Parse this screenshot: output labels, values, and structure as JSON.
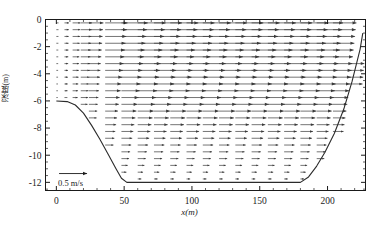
{
  "figure": {
    "type": "vector-field-section",
    "axes": {
      "xlabel": "x(m)",
      "ylabel": "深度(m)",
      "xticks": [
        0,
        50,
        100,
        150,
        200
      ],
      "xtick_labels": [
        "0",
        "50",
        "100",
        "150",
        "200"
      ],
      "yticks": [
        0,
        -2,
        -4,
        -6,
        -8,
        -10,
        -12
      ],
      "ytick_labels": [
        "0",
        "-2",
        "-4",
        "-6",
        "-8",
        "-10",
        "-12"
      ],
      "xlim": [
        -8,
        228
      ],
      "ylim": [
        -12.6,
        0
      ],
      "xminor_step": 10,
      "yminor_step": 0.5,
      "grid": false
    },
    "scale_arrow": {
      "label": "0.5 m/s",
      "value": 0.5,
      "units": "m/s",
      "x_position": 2,
      "y_position": -11.9
    },
    "colors": {
      "arrow": "#3a3a3a",
      "bed_line": "#2b2b2b",
      "axis": "#1a1a1a",
      "background": "#ffffff"
    }
  },
  "chart_data": {
    "type": "scatter",
    "title": "",
    "xlabel": "x(m)",
    "ylabel": "深度(m)",
    "xlim": [
      -8,
      228
    ],
    "ylim": [
      -12.6,
      0
    ],
    "grid": false,
    "legend": "none",
    "annotations": [
      "0.5 m/s"
    ],
    "bed_profile": {
      "name": "bed elevation",
      "x": [
        0,
        8,
        14,
        20,
        26,
        32,
        38,
        44,
        48,
        52,
        180,
        186,
        192,
        198,
        205,
        212,
        218,
        224,
        226
      ],
      "y": [
        -6.0,
        -6.05,
        -6.3,
        -6.9,
        -7.8,
        -8.8,
        -9.9,
        -11.0,
        -11.7,
        -12.0,
        -12.0,
        -11.6,
        -10.8,
        -9.8,
        -8.4,
        -6.6,
        -4.6,
        -2.2,
        -1.0
      ]
    },
    "vector_field": {
      "description": "Horizontal velocity vectors in a vertical section; arrows point in +x direction, longest near the free surface and shortest near the bed and near the left boundary.",
      "column_x": [
        0,
        6,
        12,
        18,
        24,
        36,
        48,
        60,
        72,
        84,
        96,
        108,
        120,
        132,
        144,
        156,
        168,
        180,
        192,
        204,
        216,
        224
      ],
      "row_depth": [
        -0.25,
        -0.75,
        -1.25,
        -1.75,
        -2.25,
        -2.75,
        -3.25,
        -3.75,
        -4.25,
        -4.75,
        -5.25,
        -5.75,
        -6.25,
        -6.75,
        -7.25,
        -7.75,
        -8.25,
        -8.75,
        -9.25,
        -9.75,
        -10.25,
        -10.75,
        -11.25,
        -11.75
      ],
      "u_surface_by_column": [
        0.04,
        0.08,
        0.14,
        0.2,
        0.26,
        0.4,
        0.47,
        0.5,
        0.5,
        0.5,
        0.5,
        0.5,
        0.5,
        0.5,
        0.5,
        0.5,
        0.5,
        0.5,
        0.47,
        0.42,
        0.33,
        0.26
      ],
      "u_profile_shape": [
        1.0,
        0.97,
        0.94,
        0.91,
        0.88,
        0.85,
        0.82,
        0.79,
        0.76,
        0.72,
        0.69,
        0.65,
        0.61,
        0.57,
        0.53,
        0.49,
        0.45,
        0.41,
        0.37,
        0.33,
        0.29,
        0.24,
        0.19,
        0.13
      ],
      "v": 0.0,
      "units": "m/s"
    }
  }
}
